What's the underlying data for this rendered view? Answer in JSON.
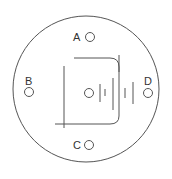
{
  "diagram": {
    "type": "electrode-pad-schematic",
    "colors": {
      "stroke": "#555555",
      "background": "#ffffff",
      "label": "#333333"
    },
    "outer_circle": {
      "cx": 86,
      "cy": 89,
      "r": 73
    },
    "electrodes": [
      {
        "id": "A",
        "label": "A",
        "cx": 90,
        "cy": 37,
        "r": 4.5,
        "label_x": 73,
        "label_y": 41
      },
      {
        "id": "B",
        "label": "B",
        "cx": 29,
        "cy": 92,
        "r": 4.5,
        "label_x": 25,
        "label_y": 85
      },
      {
        "id": "D",
        "label": "D",
        "cx": 148,
        "cy": 93,
        "r": 4.5,
        "label_x": 144,
        "label_y": 85
      },
      {
        "id": "C",
        "label": "C",
        "cx": 89,
        "cy": 145,
        "r": 4.5,
        "label_x": 73,
        "label_y": 149
      }
    ],
    "center_circle": {
      "cx": 89,
      "cy": 93,
      "r": 4.5
    }
  }
}
